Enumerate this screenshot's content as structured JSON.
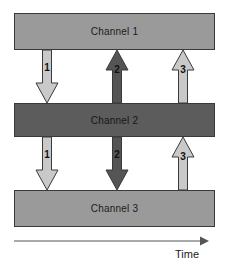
{
  "diagram": {
    "colors": {
      "channel_light": "#9a9a9a",
      "channel_dark": "#5c5c5c",
      "arrow_light": "#c9c9c9",
      "arrow_dark": "#555555",
      "outline": "#3a3a3a",
      "background": "#ffffff",
      "axis": "#555555"
    },
    "channels": [
      {
        "id": "channel-1",
        "label": "Channel 1",
        "shade": "light",
        "x": 14,
        "y": 13,
        "width": 201,
        "height": 37
      },
      {
        "id": "channel-2",
        "label": "Channel 2",
        "shade": "dark",
        "x": 14,
        "y": 103,
        "width": 201,
        "height": 34
      },
      {
        "id": "channel-3",
        "label": "Channel 3",
        "shade": "light",
        "x": 14,
        "y": 190,
        "width": 201,
        "height": 37
      }
    ],
    "arrows": [
      {
        "id": "arrow-top-1",
        "label": "1",
        "direction": "down",
        "shade": "light",
        "from": "Channel 1",
        "to": "Channel 2",
        "cx": 47,
        "top": 50,
        "height": 53,
        "label_y": 12
      },
      {
        "id": "arrow-top-2",
        "label": "2",
        "direction": "up",
        "shade": "dark",
        "from": "Channel 2",
        "to": "Channel 1",
        "cx": 117,
        "top": 50,
        "height": 53,
        "label_y": 14
      },
      {
        "id": "arrow-top-3",
        "label": "3",
        "direction": "up",
        "shade": "light",
        "from": "Channel 2",
        "to": "Channel 1",
        "cx": 183,
        "top": 50,
        "height": 53,
        "label_y": 14
      },
      {
        "id": "arrow-bottom-1",
        "label": "1",
        "direction": "down",
        "shade": "light",
        "from": "Channel 2",
        "to": "Channel 3",
        "cx": 47,
        "top": 137,
        "height": 53,
        "label_y": 12
      },
      {
        "id": "arrow-bottom-2",
        "label": "2",
        "direction": "down",
        "shade": "dark",
        "from": "Channel 2",
        "to": "Channel 3",
        "cx": 117,
        "top": 137,
        "height": 53,
        "label_y": 12
      },
      {
        "id": "arrow-bottom-3",
        "label": "3",
        "direction": "up",
        "shade": "light",
        "from": "Channel 3",
        "to": "Channel 2",
        "cx": 183,
        "top": 137,
        "height": 53,
        "label_y": 14
      }
    ],
    "time_axis": {
      "label": "Time",
      "x": 14,
      "y": 240,
      "length": 193,
      "label_x": 175,
      "label_y": 248
    }
  }
}
